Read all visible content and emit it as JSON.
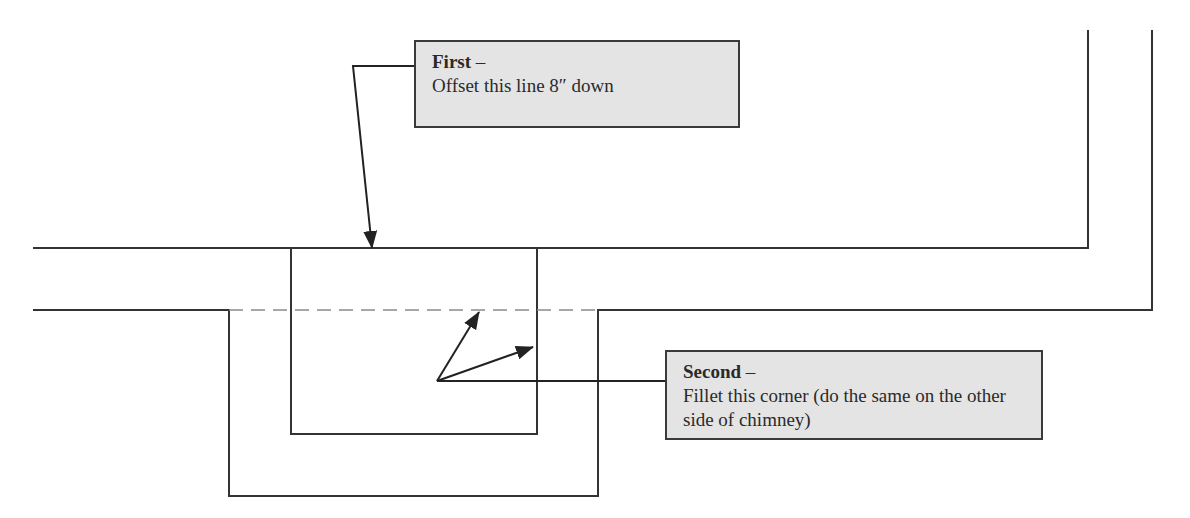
{
  "callouts": {
    "first": {
      "title": "First",
      "separator": " –",
      "body": "Offset this line 8″ down"
    },
    "second": {
      "title": "Second",
      "separator": " –",
      "body": "Fillet this corner (do the same on the other side of chimney)"
    }
  },
  "colors": {
    "line": "#333333",
    "dashed": "#8a8a8a",
    "callout_fill": "#e4e4e4",
    "callout_border": "#3a3a3a"
  }
}
